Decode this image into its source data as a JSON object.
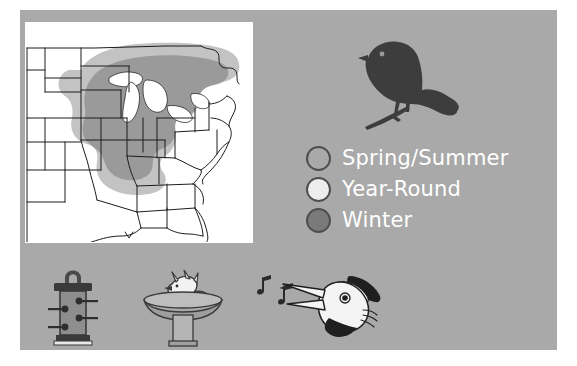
{
  "panel": {
    "background_color": "#a9a9a9",
    "outer_background_color": "#ffffff"
  },
  "map": {
    "name": "Eastern United States range map",
    "background_color": "#ffffff",
    "state_outline_color": "#1a1a1a",
    "range_fill_color": "#9a9a9a",
    "halo_fill_color": "#c4c4c4",
    "lake_fill_color": "#ffffff",
    "region_described": "Eastern and midwestern United States"
  },
  "bird": {
    "name": "perched songbird silhouette",
    "fill_color": "#3d3d3d"
  },
  "legend": {
    "title": "",
    "items": [
      {
        "label": "Spring/Summer",
        "swatch_color": "#a9a9a9",
        "swatch_border": "#4e4e4e",
        "icon": "circle-swatch-icon"
      },
      {
        "label": "Year-Round",
        "swatch_color": "#ededed",
        "swatch_border": "#4e4e4e",
        "icon": "circle-swatch-icon"
      },
      {
        "label": "Winter",
        "swatch_color": "#7a7a7a",
        "swatch_border": "#4e4e4e",
        "icon": "circle-swatch-icon"
      }
    ],
    "text_color": "#ffffff"
  },
  "icons": [
    {
      "id": "feeder",
      "name": "tube-bird-feeder-icon",
      "label": "Tube bird feeder"
    },
    {
      "id": "birdbath",
      "name": "bird-bath-icon",
      "label": "Bird bath with bathing bird"
    },
    {
      "id": "singing",
      "name": "singing-bird-head-icon",
      "label": "Singing bird head with music notes"
    }
  ]
}
